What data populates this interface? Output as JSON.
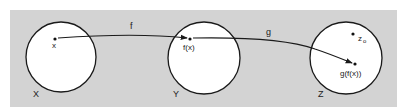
{
  "diagram": {
    "colors": {
      "panel": "#d3d3d3",
      "circle_fill": "#ffffff",
      "stroke": "#1a1a1a"
    },
    "sets": [
      {
        "id": "X",
        "label": "X"
      },
      {
        "id": "Y",
        "label": "Y"
      },
      {
        "id": "Z",
        "label": "Z"
      }
    ],
    "maps": [
      {
        "id": "f",
        "label": "f",
        "from": "X",
        "to": "Y"
      },
      {
        "id": "g",
        "label": "g",
        "from": "Y",
        "to": "Z"
      }
    ],
    "points": [
      {
        "id": "x",
        "label": "x",
        "in": "X"
      },
      {
        "id": "fx",
        "label": "f(x)",
        "in": "Y"
      },
      {
        "id": "gfx",
        "label": "g(f(x))",
        "in": "Z"
      },
      {
        "id": "z0",
        "label": "z",
        "subscript": "o",
        "in": "Z"
      }
    ]
  }
}
